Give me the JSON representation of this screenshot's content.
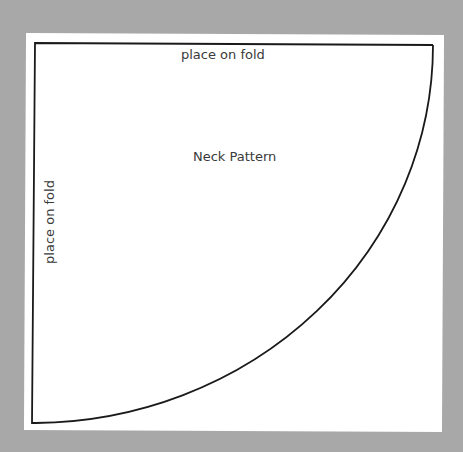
{
  "diagram": {
    "title": "Neck Pattern",
    "labels": {
      "top_edge": "place on fold",
      "left_edge": "place on fold"
    },
    "shape": "quarter-ellipse",
    "colors": {
      "background": "#a8a8a8",
      "paper": "#ffffff",
      "outline": "#1a1a1a",
      "text": "#3a3a3a"
    }
  }
}
